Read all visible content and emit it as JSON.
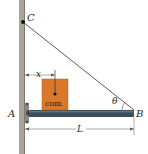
{
  "diagram": {
    "labels": {
      "C": "C",
      "A": "A",
      "B": "B",
      "x": "x",
      "L": "L",
      "theta": "θ",
      "com": "com"
    },
    "colors": {
      "wall": "#a8a39b",
      "wall_edge": "#7d7870",
      "beam": "#3c4f5c",
      "beam_highlight": "#5d7584",
      "box": "#d9782a",
      "box_edge": "#b85f1c",
      "cable": "#333333",
      "text": "#222222",
      "dim_line": "#555555"
    }
  }
}
